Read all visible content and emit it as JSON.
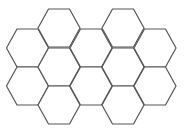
{
  "diagram": {
    "type": "hexagonal-tiling",
    "stroke_color": "#555555",
    "fill_color": "#ffffff",
    "background": "#ffffff",
    "hex_count": 12,
    "columns": [
      {
        "cx": 27.5,
        "rows_cy": [
          48,
          86
        ]
      },
      {
        "cx": 59,
        "rows_cy": [
          28,
          67,
          105
        ]
      },
      {
        "cx": 91,
        "rows_cy": [
          48,
          86
        ]
      },
      {
        "cx": 123,
        "rows_cy": [
          28,
          67,
          105
        ]
      },
      {
        "cx": 155,
        "rows_cy": [
          48,
          86
        ]
      }
    ],
    "hex_radius": 21,
    "hex_half_height": 19
  }
}
